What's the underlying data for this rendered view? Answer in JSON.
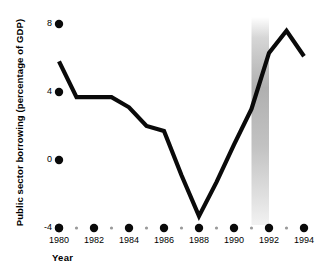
{
  "chart_data": {
    "type": "line",
    "title": "",
    "xlabel": "Year",
    "ylabel": "Public sector borrowing (percentage of GDP)",
    "x": [
      1980,
      1981,
      1982,
      1983,
      1984,
      1985,
      1986,
      1987,
      1988,
      1989,
      1990,
      1991,
      1992,
      1993,
      1994
    ],
    "values": [
      5.8,
      3.7,
      3.7,
      3.7,
      3.1,
      2.0,
      1.7,
      -0.9,
      -3.3,
      -1.3,
      0.9,
      3.0,
      6.3,
      7.6,
      6.1
    ],
    "series": [
      {
        "name": "Public sector borrowing",
        "values": [
          5.8,
          3.7,
          3.7,
          3.7,
          3.1,
          2.0,
          1.7,
          -0.9,
          -3.3,
          -1.3,
          0.9,
          3.0,
          6.3,
          7.6,
          6.1
        ]
      }
    ],
    "xlim": [
      1980,
      1994
    ],
    "ylim": [
      -4,
      8
    ],
    "ytick_labels": [
      "8",
      "4",
      "0",
      "-4"
    ],
    "ytick_values": [
      8,
      4,
      0,
      -4
    ],
    "xtick_labels": [
      "1980",
      "1982",
      "1984",
      "1986",
      "1988",
      "1990",
      "1992",
      "1994"
    ],
    "xtick_values": [
      1980,
      1982,
      1984,
      1986,
      1988,
      1990,
      1992,
      1994
    ],
    "xminor_values": [
      1981,
      1983,
      1985,
      1987,
      1989,
      1991,
      1993
    ],
    "grid": false,
    "legend": "none",
    "line_color": "#0a0a0a",
    "tick_marker_color": "#0a0a0a",
    "minor_marker_color": "#9a9a9a",
    "background_color": "#ffffff",
    "annotations": [
      {
        "name": "shaded-band",
        "kind": "vertical-band",
        "x_start": 1991,
        "x_end": 1992,
        "color": "#b5b5b5",
        "style": "vertical-gradient"
      }
    ]
  }
}
